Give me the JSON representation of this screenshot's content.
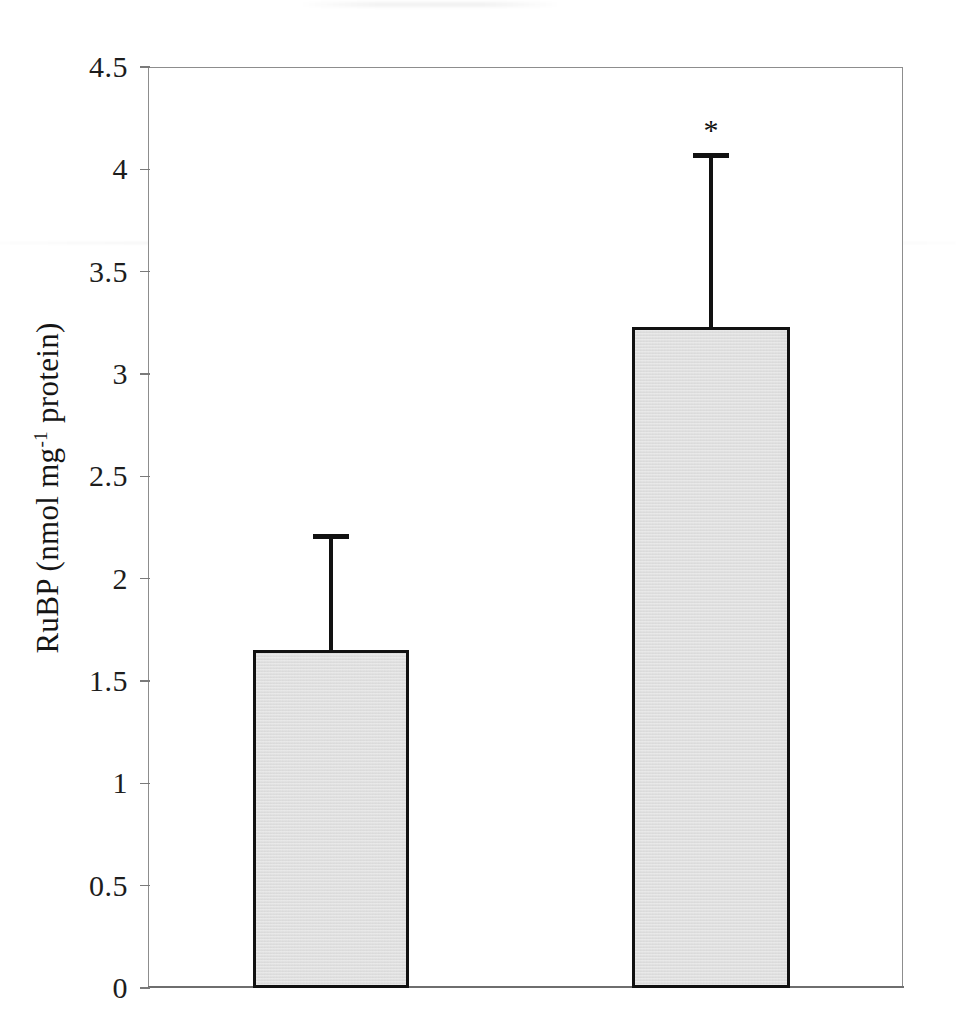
{
  "chart_data": {
    "type": "bar",
    "title": "",
    "subtitle": "",
    "xlabel": "",
    "ylabel": "RuBP (nmol mg-1 protein)",
    "ylabel_parts": {
      "prefix": "RuBP (nmol mg",
      "superscript": "-1",
      "suffix": " protein)"
    },
    "categories": [
      "",
      ""
    ],
    "values": [
      1.65,
      3.23
    ],
    "errors": [
      0.57,
      0.85
    ],
    "error_tops": [
      2.22,
      4.08
    ],
    "ylim": [
      0,
      4.5
    ],
    "yticks": [
      0,
      0.5,
      1,
      1.5,
      2,
      2.5,
      3,
      3.5,
      4,
      4.5
    ],
    "ytick_labels": [
      "0",
      "0.5",
      "1",
      "1.5",
      "2",
      "2.5",
      "3",
      "3.5",
      "4",
      "4.5"
    ],
    "grid": false,
    "legend": null,
    "annotations": [
      {
        "text": "*",
        "series_index": 1,
        "y": 4.26,
        "note": "significance marker above second bar error bar"
      }
    ],
    "bar_fill_color": "#dcdcdc",
    "bar_edge_color": "#111111",
    "error_bar_color": "#111111",
    "axis_color": "#8d8d8d",
    "background_color": "#ffffff"
  },
  "figure": {
    "width": 956,
    "height": 1036,
    "plot_left": 148,
    "plot_top": 67,
    "plot_width": 755,
    "plot_height": 921
  },
  "bars": [
    {
      "name": "bar-1",
      "value": 1.65,
      "error": 0.57,
      "left": 253,
      "width": 156,
      "marker": ""
    },
    {
      "name": "bar-2",
      "value": 3.23,
      "error": 0.85,
      "left": 632,
      "width": 158,
      "marker": "*"
    }
  ]
}
